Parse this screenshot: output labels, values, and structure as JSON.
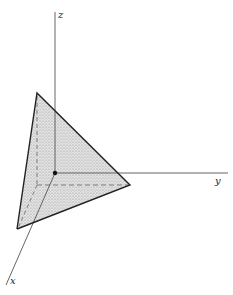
{
  "diagram": {
    "type": "3d-coordinate-plane-intercept",
    "axes": {
      "x": {
        "label": "x"
      },
      "y": {
        "label": "y"
      },
      "z": {
        "label": "z"
      }
    },
    "origin": {
      "marker": "filled-dot"
    },
    "plane": {
      "description": "triangular plane region cutting all three axes, shaded with stipple",
      "fill": "#d9d9d9",
      "edge_color": "#222222"
    },
    "colors": {
      "axis": "#555555",
      "edge": "#222222",
      "dashed": "#555555",
      "shade": "#d9d9d9"
    }
  }
}
